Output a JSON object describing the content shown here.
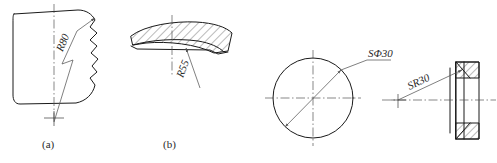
{
  "figure": {
    "background_color": "#ffffff",
    "line_color": "#1a1a1a",
    "thin_line_color": "#555555",
    "text_color": "#2a2a2a",
    "width": 497,
    "height": 163
  },
  "parts": [
    {
      "id": "a",
      "caption": "(a)",
      "type": "broken-view-with-radius",
      "dimension_label": "R80",
      "dimension_value": 80,
      "dimension_prefix": "R",
      "leader_style": "zigzag-foreshortened",
      "has_break_line": true,
      "has_vertical_centerline": true,
      "has_center_cross": true
    },
    {
      "id": "b",
      "caption": "(b)",
      "type": "section-view-hatched",
      "dimension_label": "R55",
      "dimension_value": 55,
      "dimension_prefix": "R",
      "leader_style": "straight-arrow",
      "hatched": true,
      "has_vertical_centerline": true
    },
    {
      "id": "c",
      "caption": "",
      "type": "circle-with-spherical-diameter",
      "dimension_label": "SΦ30",
      "dimension_value": 30,
      "dimension_prefix": "SΦ",
      "leader_style": "double-arrow-diameter",
      "has_crosshair_centerlines": true
    },
    {
      "id": "d",
      "caption": "",
      "type": "section-ring-with-spherical-radius",
      "dimension_label": "SR30",
      "dimension_value": 30,
      "dimension_prefix": "SR",
      "leader_style": "straight-arrow",
      "hatched": true,
      "has_horizontal_centerline": true,
      "has_center_cross": true
    }
  ]
}
